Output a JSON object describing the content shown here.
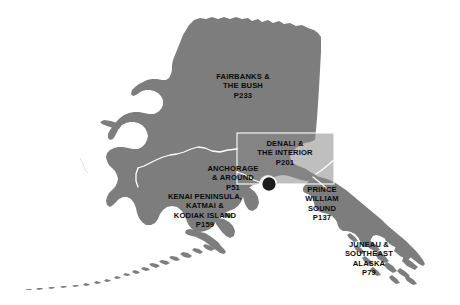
{
  "map": {
    "title": "Alaska Regions Overview Map",
    "subject": "Alaska",
    "colors": {
      "land": "#7d7d7d",
      "land_inset": "#878787",
      "water_background": "#ffffff",
      "boundary_line": "#ffffff",
      "label_text": "#0a0a0a",
      "marker": "#1c1c1c"
    },
    "regions": [
      {
        "id": "fairbanks-and-the-bush",
        "lines": [
          "FAIRBANKS &",
          "THE BUSH"
        ],
        "line1": "FAIRBANKS &",
        "line2": "THE BUSH",
        "page": "p233"
      },
      {
        "id": "denali-and-the-interior",
        "lines": [
          "DENALI &",
          "THE INTERIOR"
        ],
        "line1": "DENALI &",
        "line2": "THE INTERIOR",
        "page": "p201"
      },
      {
        "id": "anchorage-and-around",
        "lines": [
          "ANCHORAGE",
          "& AROUND"
        ],
        "line1": "ANCHORAGE",
        "line2": "& AROUND",
        "page": "p51"
      },
      {
        "id": "kenai-peninsula-katmai-and-kodiak-island",
        "lines": [
          "KENAI PENINSULA,",
          "KATMAI &",
          "KODIAK ISLAND"
        ],
        "line1": "KENAI PENINSULA,",
        "line2": "KATMAI &",
        "line3": "KODIAK ISLAND",
        "page": "p159"
      },
      {
        "id": "prince-william-sound",
        "lines": [
          "PRINCE",
          "WILLIAM",
          "SOUND"
        ],
        "line1": "PRINCE",
        "line2": "WILLIAM",
        "line3": "SOUND",
        "page": "p137"
      },
      {
        "id": "juneau-and-southeast-alaska",
        "lines": [
          "JUNEAU &",
          "SOUTHEAST",
          "ALASKA"
        ],
        "line1": "JUNEAU &",
        "line2": "SOUTHEAST",
        "line3": "ALASKA",
        "page": "p79"
      }
    ],
    "markers": [
      {
        "id": "anchorage-marker",
        "name": "Anchorage city marker"
      }
    ]
  }
}
